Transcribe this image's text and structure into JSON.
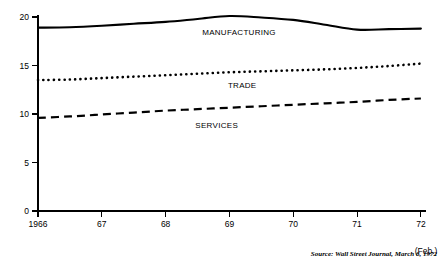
{
  "chart_data": {
    "type": "line",
    "title": "",
    "subtitle": "",
    "xlabel": "",
    "ylabel": "",
    "xlim": [
      1966,
      1972.08
    ],
    "ylim": [
      0,
      20
    ],
    "grid": false,
    "legend": "inline-labels",
    "x_tick_labels": [
      "1966",
      "67",
      "68",
      "69",
      "70",
      "71",
      "72"
    ],
    "x_tick_values": [
      1966,
      1967,
      1968,
      1969,
      1970,
      1971,
      1972
    ],
    "x_axis_sub_label": "(Feb.)",
    "y_tick_labels": [
      "0",
      "5",
      "10",
      "15",
      "20"
    ],
    "y_tick_values": [
      0,
      5,
      10,
      15,
      20
    ],
    "x": [
      1966,
      1966.5,
      1967,
      1967.5,
      1968,
      1968.5,
      1969,
      1969.5,
      1970,
      1970.5,
      1971,
      1971.5,
      1972
    ],
    "series": [
      {
        "name": "MANUFACTURING",
        "style": "solid",
        "label_x": 1969.15,
        "label_y": 18.1,
        "values": [
          18.9,
          18.95,
          19.1,
          19.3,
          19.5,
          19.8,
          20.1,
          19.95,
          19.7,
          19.2,
          18.7,
          18.75,
          18.8
        ]
      },
      {
        "name": "TRADE",
        "style": "dotted",
        "label_x": 1969.2,
        "label_y": 12.7,
        "values": [
          13.5,
          13.55,
          13.7,
          13.85,
          14.0,
          14.15,
          14.3,
          14.4,
          14.5,
          14.6,
          14.75,
          14.95,
          15.2
        ]
      },
      {
        "name": "SERVICES",
        "style": "dashed",
        "label_x": 1968.8,
        "label_y": 8.6,
        "values": [
          9.6,
          9.75,
          9.95,
          10.15,
          10.35,
          10.5,
          10.65,
          10.8,
          10.95,
          11.1,
          11.25,
          11.45,
          11.6
        ]
      }
    ],
    "source_note": "Source: Wall Street Journal, March 6, 1972"
  }
}
